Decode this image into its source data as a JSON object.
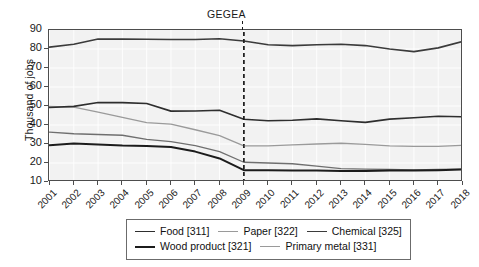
{
  "chart_data": {
    "type": "line",
    "title": "",
    "xlabel": "",
    "ylabel": "Thousand of jobs",
    "annotation": "GEGEA",
    "annotation_x": "2009",
    "grid": true,
    "legend_position": "bottom",
    "xlim": [
      2001,
      2018
    ],
    "ylim": [
      10,
      90
    ],
    "yticks": [
      90,
      80,
      70,
      60,
      50,
      40,
      30,
      20,
      10
    ],
    "categories": [
      "2001",
      "2002",
      "2003",
      "2004",
      "2005",
      "2006",
      "2007",
      "2008",
      "2009",
      "2010",
      "2011",
      "2012",
      "2013",
      "2014",
      "2015",
      "2016",
      "2017",
      "2018"
    ],
    "series": [
      {
        "name": "Chemical [325]",
        "code": "325",
        "label": "Chemical",
        "color": "#3b3b3b",
        "width": 1.6,
        "values": [
          81.0,
          82.5,
          85.3,
          85.2,
          85.1,
          85.0,
          85.0,
          85.4,
          84.2,
          82.2,
          81.8,
          82.2,
          82.5,
          81.8,
          80.0,
          78.6,
          80.6,
          84.0
        ]
      },
      {
        "name": "Food [311]",
        "code": "311",
        "label": "Food",
        "color": "#2e2e2e",
        "width": 1.6,
        "values": [
          49.2,
          49.8,
          51.8,
          51.8,
          51.3,
          47.3,
          47.4,
          47.8,
          43.0,
          42.2,
          42.5,
          43.2,
          42.2,
          41.4,
          43.1,
          43.8,
          44.6,
          44.3
        ]
      },
      {
        "name": "Paper [322]",
        "code": "322",
        "label": "Paper",
        "color": "#9a9a9a",
        "width": 1.3,
        "values": [
          49.8,
          49.4,
          46.8,
          44.0,
          41.2,
          40.5,
          37.5,
          34.4,
          29.0,
          29.0,
          29.5,
          30.0,
          30.4,
          29.8,
          29.0,
          28.8,
          28.7,
          29.3
        ]
      },
      {
        "name": "Primary metal [331]",
        "code": "331",
        "label": "Primary metal",
        "color": "#6f6f6f",
        "width": 1.3,
        "values": [
          36.2,
          35.4,
          35.0,
          34.6,
          32.4,
          31.2,
          29.2,
          26.0,
          20.4,
          20.0,
          19.6,
          18.4,
          17.0,
          16.8,
          16.6,
          16.4,
          16.6,
          16.8
        ]
      },
      {
        "name": "Wood product [321]",
        "code": "321",
        "label": "Wood product",
        "color": "#1c1c1c",
        "width": 2.0,
        "values": [
          29.4,
          30.2,
          29.8,
          29.2,
          29.0,
          28.4,
          26.0,
          22.4,
          16.2,
          16.2,
          16.1,
          16.0,
          15.8,
          15.8,
          16.0,
          16.0,
          16.2,
          16.6
        ]
      }
    ]
  },
  "legend": {
    "row1": [
      {
        "label": "Food [311]",
        "color": "#2e2e2e",
        "width": 1.8
      },
      {
        "label": "Paper [322]",
        "color": "#9a9a9a",
        "width": 1.4
      },
      {
        "label": "Chemical [325]",
        "color": "#3b3b3b",
        "width": 1.8
      }
    ],
    "row2": [
      {
        "label": "Wood product  [321]",
        "color": "#1c1c1c",
        "width": 2.2
      },
      {
        "label": "Primary metal [331]",
        "color": "#9a9a9a",
        "width": 1.4
      }
    ]
  }
}
